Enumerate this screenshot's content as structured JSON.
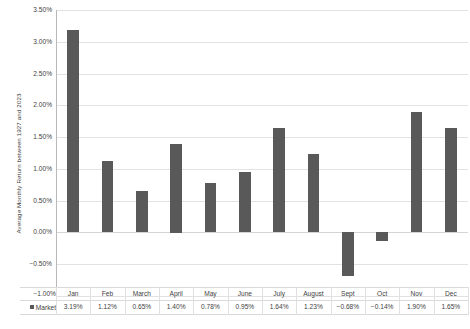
{
  "chart_data": {
    "type": "bar",
    "title": "",
    "xlabel": "",
    "ylabel": "Average Monthly Return between 1927 and 2023",
    "ylim": [
      -1.0,
      3.5
    ],
    "ytick_step": 0.5,
    "grid": true,
    "legend_position": "table-left",
    "categories": [
      "Jan",
      "Feb",
      "March",
      "April",
      "May",
      "June",
      "July",
      "August",
      "Sept",
      "Oct",
      "Nov",
      "Dec"
    ],
    "series": [
      {
        "name": "Market",
        "values": [
          3.19,
          1.12,
          0.65,
          1.4,
          0.78,
          0.95,
          1.64,
          1.23,
          -0.68,
          -0.14,
          1.9,
          1.65
        ],
        "labels": [
          "3.19%",
          "1.12%",
          "0.65%",
          "1.40%",
          "0.78%",
          "0.95%",
          "1.64%",
          "1.23%",
          "−0.68%",
          "−0.14%",
          "1.90%",
          "1.65%"
        ],
        "color": "#595959"
      }
    ],
    "ytick_labels": [
      "3.50%",
      "3.00%",
      "2.50%",
      "2.00%",
      "1.50%",
      "1.00%",
      "0.50%",
      "0.00%",
      "−0.50%",
      "−1.00%"
    ],
    "ytick_values": [
      3.5,
      3.0,
      2.5,
      2.0,
      1.5,
      1.0,
      0.5,
      0.0,
      -0.5,
      -1.0
    ]
  },
  "axis": {
    "y_title": "Average Monthly Return between 1927 and 2023"
  },
  "legend": {
    "series_label": "Market"
  },
  "colors": {
    "bar": "#595959",
    "gridline": "#e2e2e2",
    "axis": "#b9b9b9",
    "text": "#3f3f3f",
    "background": "#ffffff"
  }
}
